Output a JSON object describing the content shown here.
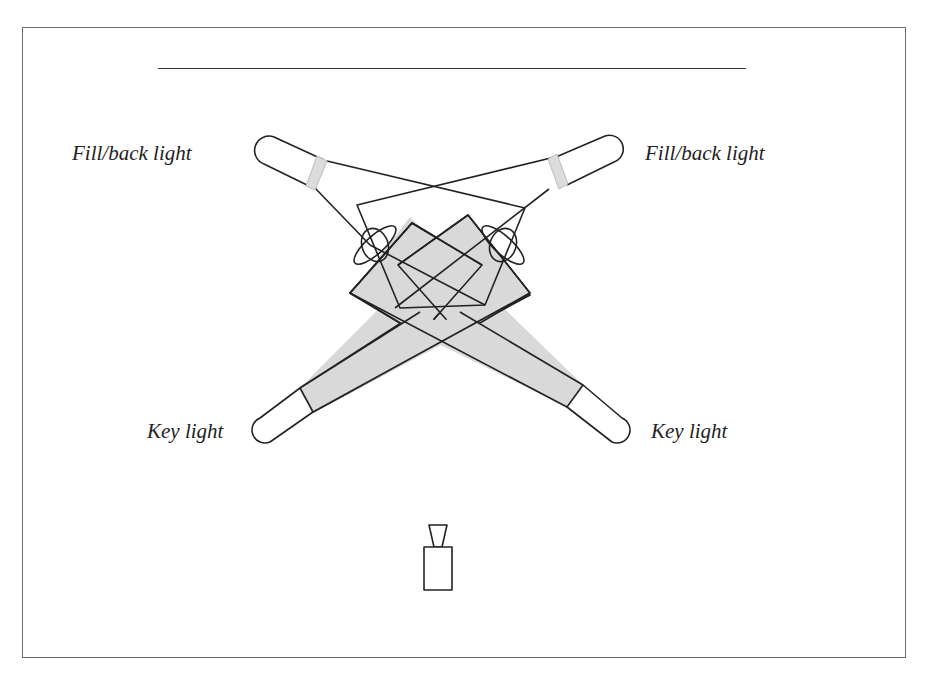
{
  "diagram": {
    "labels": {
      "fill_back_left": "Fill/back light",
      "fill_back_right": "Fill/back light",
      "key_left": "Key light",
      "key_right": "Key light"
    },
    "elements": {
      "lights": [
        {
          "id": "fill-back-left",
          "label": "Fill/back light",
          "position": "upper-left",
          "beam": "outline"
        },
        {
          "id": "fill-back-right",
          "label": "Fill/back light",
          "position": "upper-right",
          "beam": "outline"
        },
        {
          "id": "key-left",
          "label": "Key light",
          "position": "lower-left",
          "beam": "shaded"
        },
        {
          "id": "key-right",
          "label": "Key light",
          "position": "lower-right",
          "beam": "shaded"
        }
      ],
      "subjects": 2,
      "camera": {
        "position": "bottom-center"
      }
    },
    "colors": {
      "stroke": "#222222",
      "beam_fill": "#d9d9d9",
      "band_fill": "#dcdcdc",
      "frame": "#6a6a6a",
      "background": "#ffffff"
    }
  }
}
